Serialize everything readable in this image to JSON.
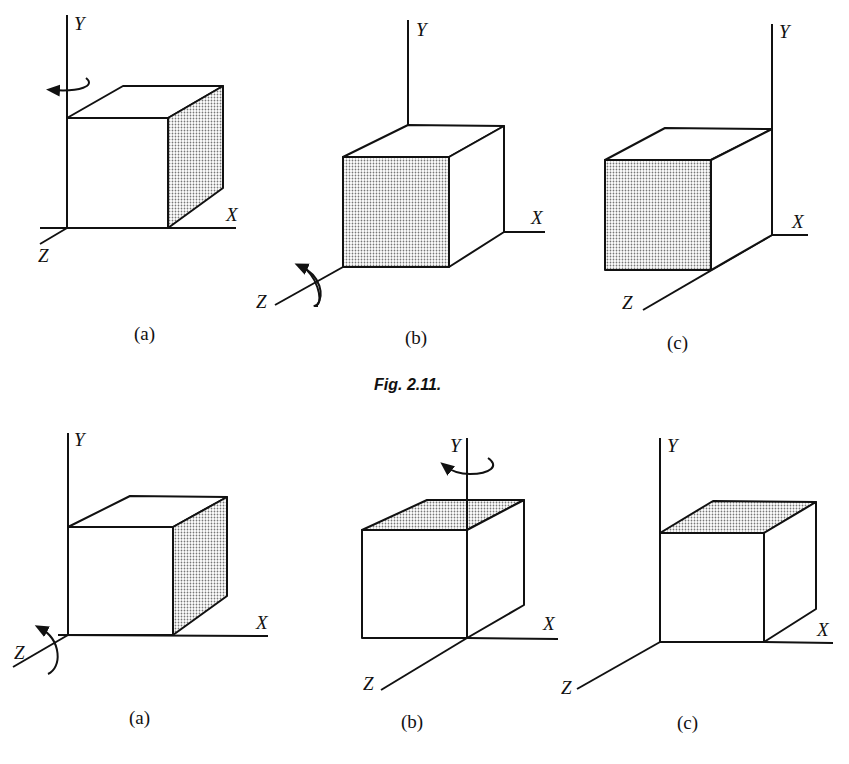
{
  "figure_caption": "Fig. 2.11.",
  "axis_labels": {
    "x": "X",
    "y": "Y",
    "z": "Z"
  },
  "rows": [
    {
      "panels": [
        {
          "caption": "(a)",
          "shaded_face": "right",
          "rotation_axis": "Y"
        },
        {
          "caption": "(b)",
          "shaded_face": "front",
          "rotation_axis": "Z"
        },
        {
          "caption": "(c)",
          "shaded_face": "front",
          "rotation_axis": "none"
        }
      ]
    },
    {
      "panels": [
        {
          "caption": "(a)",
          "shaded_face": "right",
          "rotation_axis": "Z"
        },
        {
          "caption": "(b)",
          "shaded_face": "top",
          "rotation_axis": "Y"
        },
        {
          "caption": "(c)",
          "shaded_face": "top",
          "rotation_axis": "none"
        }
      ]
    }
  ],
  "colors": {
    "ink": "#111111",
    "background": "#ffffff",
    "shade": "#9a9a9a"
  }
}
